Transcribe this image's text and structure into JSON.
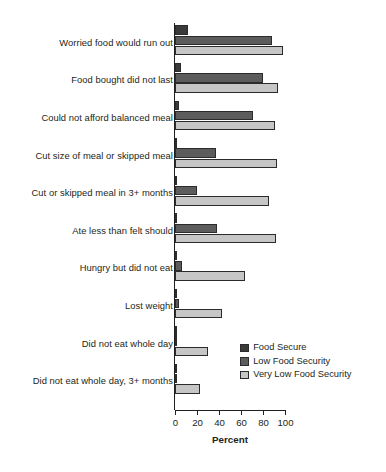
{
  "chart_data": {
    "type": "bar",
    "orientation": "horizontal",
    "title": "",
    "xlabel": "Percent",
    "ylabel": "",
    "xlim": [
      0,
      100
    ],
    "xticks": [
      0,
      20,
      40,
      60,
      80,
      100
    ],
    "xtick_labels": [
      "0",
      "20",
      "40",
      "60",
      "80",
      "100"
    ],
    "grid": false,
    "legend_position": "inside-lower-right",
    "categories": [
      "Worried food would run out",
      "Food bought did not last",
      "Could not afford balanced meal",
      "Cut size of meal or skipped meal",
      "Cut or skipped meal in 3+ months",
      "Ate less than felt should",
      "Hungry but did not eat",
      "Lost weight",
      "Did not eat whole day",
      "Did not eat whole day, 3+ months"
    ],
    "series": [
      {
        "name": "Food Secure",
        "color": "#3a3a3a",
        "values": [
          12,
          5,
          4,
          1,
          1,
          1,
          0.5,
          0.3,
          0.2,
          0.2
        ]
      },
      {
        "name": "Low Food Security",
        "color": "#5c5c5c",
        "values": [
          88,
          80,
          71,
          37,
          20,
          38,
          6,
          4,
          1,
          0.5
        ]
      },
      {
        "name": "Very Low Food Security",
        "color": "#c6c6c6",
        "values": [
          98,
          94,
          91,
          93,
          85,
          92,
          64,
          43,
          30,
          23
        ]
      }
    ]
  },
  "axis": {
    "x_title": "Percent"
  }
}
